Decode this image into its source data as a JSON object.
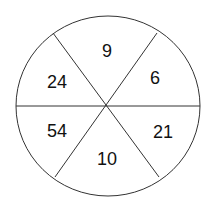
{
  "diagram": {
    "type": "number-wheel",
    "segments": [
      {
        "position": "top",
        "value": "9"
      },
      {
        "position": "upper-right",
        "value": "6"
      },
      {
        "position": "lower-right",
        "value": "21"
      },
      {
        "position": "bottom",
        "value": "10"
      },
      {
        "position": "lower-left",
        "value": "54"
      },
      {
        "position": "upper-left",
        "value": "24"
      }
    ]
  }
}
